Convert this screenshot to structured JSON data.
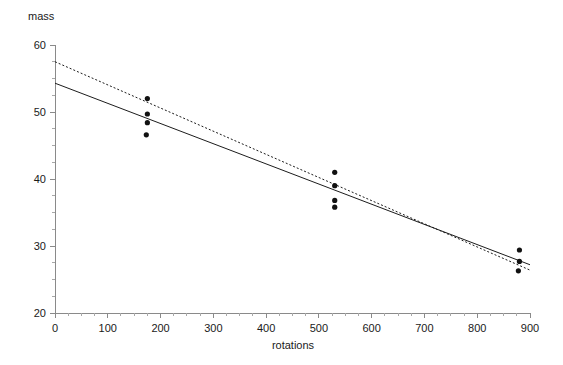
{
  "chart_data": {
    "type": "scatter",
    "title": "",
    "xlabel": "rotations",
    "ylabel": "mass",
    "xlim": [
      0,
      900
    ],
    "ylim": [
      20,
      60
    ],
    "grid": false,
    "legend": "none",
    "x_ticks": [
      0,
      100,
      200,
      300,
      400,
      500,
      600,
      700,
      800,
      900
    ],
    "x_tick_labels": [
      "0",
      "100",
      "200",
      "300",
      "400",
      "500",
      "600",
      "700",
      "800",
      "900"
    ],
    "y_ticks": [
      20,
      30,
      40,
      50,
      60
    ],
    "y_tick_labels": [
      "20",
      "30",
      "40",
      "50",
      "60"
    ],
    "x_minor_tick_step": 25,
    "y_minor_tick_step": 2.5,
    "points": [
      {
        "x": 175,
        "y": 52.0
      },
      {
        "x": 175,
        "y": 49.7
      },
      {
        "x": 175,
        "y": 48.4
      },
      {
        "x": 173,
        "y": 46.6
      },
      {
        "x": 530,
        "y": 41.0
      },
      {
        "x": 530,
        "y": 39.0
      },
      {
        "x": 530,
        "y": 36.8
      },
      {
        "x": 530,
        "y": 35.8
      },
      {
        "x": 880,
        "y": 29.4
      },
      {
        "x": 880,
        "y": 27.7
      },
      {
        "x": 878,
        "y": 26.3
      }
    ],
    "series": [
      {
        "name": "solid-fit-line",
        "style": "solid",
        "x": [
          0,
          900
        ],
        "values": [
          54.3,
          27.2
        ]
      },
      {
        "name": "dotted-fit-line",
        "style": "dotted",
        "x": [
          0,
          900
        ],
        "values": [
          57.5,
          26.4
        ]
      }
    ]
  },
  "axes": {
    "y_axis_title": "mass",
    "x_axis_title": "rotations"
  }
}
